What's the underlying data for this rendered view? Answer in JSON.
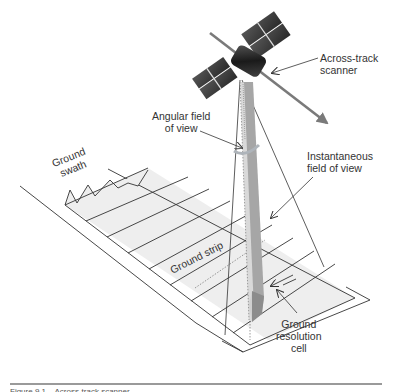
{
  "diagram": {
    "type": "remote-sensing-illustration",
    "labels": {
      "across_track_scanner": "Across-track\nscanner",
      "angular_fov": "Angular field\nof view",
      "instantaneous_fov": "Instantaneous\nfield of view",
      "ground_swath": "Ground\nswath",
      "ground_strip": "Ground strip",
      "ground_resolution_cell": "Ground\nresolution\ncell"
    },
    "colors": {
      "line": "#333333",
      "ground_fill": "#eeeeee",
      "ifov_light": "#d9d9d9",
      "ifov_dark": "#a6a6a6",
      "cell_fill": "#8c8c8c",
      "satellite_body": "#2b2b2b",
      "panel": "#3a3a3a",
      "orbit_arrow": "#7a7a7a"
    }
  },
  "caption": {
    "text": "Figure 9.1 – Across-track scanner"
  }
}
